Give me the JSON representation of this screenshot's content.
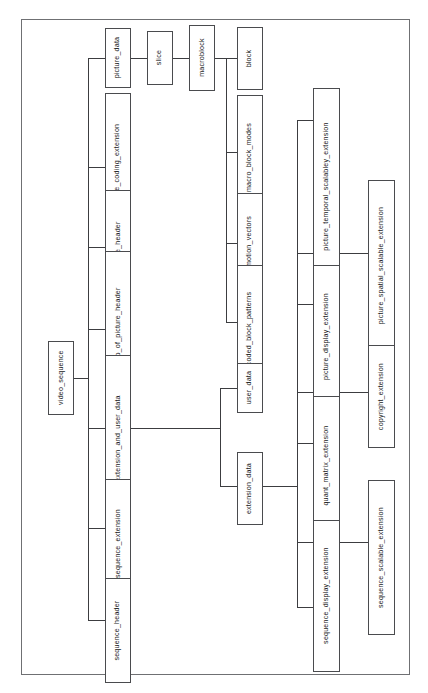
{
  "diagram": {
    "orientation": "rotated-90-ccw",
    "frame": {
      "visible": true,
      "color": "#6f7073"
    },
    "nodes": {
      "video_sequence": "video_sequence",
      "sequence_header": "sequence_header",
      "sequence_extension": "sequence_extension",
      "extension_and_user_data": "extension_and_user_data",
      "group_of_picture_header": "group_of_picture_header",
      "picture_header": "picture_header",
      "picture_coding_extension": "picture_coding_extension",
      "picture_data": "picture_data",
      "slice": "slice",
      "macroblock": "macroblock",
      "block": "block",
      "macro_block_modes": "macro_block_modes",
      "motion_vectors": "motion_vectors",
      "coded_block_patterns": "coded_block_patterns",
      "user_data": "user_data",
      "extension_data": "extension_data",
      "picture_temporal_scalabley_extension": "picture_temporal_scalabley_extension",
      "picture_spatial_scalable_extension": "picture_spatial_scalable_extension",
      "picture_display_extension": "picture_display_extension",
      "copyright_extension": "copyright_extension",
      "quant_matrix_extension": "quant_matrix_extension",
      "sequence_scalable_extension": "sequence_scalable_extension",
      "sequence_display_extension": "sequence_display_extension"
    },
    "edges": [
      {
        "from": "video_sequence",
        "to": "sequence_header"
      },
      {
        "from": "video_sequence",
        "to": "sequence_extension"
      },
      {
        "from": "video_sequence",
        "to": "extension_and_user_data"
      },
      {
        "from": "video_sequence",
        "to": "group_of_picture_header"
      },
      {
        "from": "video_sequence",
        "to": "picture_header"
      },
      {
        "from": "video_sequence",
        "to": "picture_coding_extension"
      },
      {
        "from": "video_sequence",
        "to": "picture_data"
      },
      {
        "from": "picture_data",
        "to": "slice"
      },
      {
        "from": "slice",
        "to": "macroblock"
      },
      {
        "from": "macroblock",
        "to": "block"
      },
      {
        "from": "macroblock",
        "to": "macro_block_modes"
      },
      {
        "from": "macroblock",
        "to": "motion_vectors"
      },
      {
        "from": "macroblock",
        "to": "coded_block_patterns"
      },
      {
        "from": "extension_and_user_data",
        "to": "user_data"
      },
      {
        "from": "extension_and_user_data",
        "to": "extension_data"
      },
      {
        "from": "extension_data",
        "to": "picture_temporal_scalabley_extension"
      },
      {
        "from": "extension_data",
        "to": "picture_spatial_scalable_extension"
      },
      {
        "from": "extension_data",
        "to": "picture_display_extension"
      },
      {
        "from": "extension_data",
        "to": "copyright_extension"
      },
      {
        "from": "extension_data",
        "to": "quant_matrix_extension"
      },
      {
        "from": "extension_data",
        "to": "sequence_scalable_extension"
      },
      {
        "from": "extension_data",
        "to": "sequence_display_extension"
      }
    ]
  }
}
